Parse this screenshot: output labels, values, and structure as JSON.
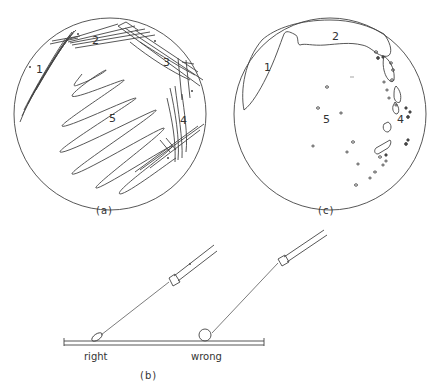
{
  "figure": {
    "panels": [
      {
        "id": "a",
        "caption": "(a)",
        "description": "Streak plate pattern: streak lines",
        "zone_labels": [
          "1",
          "2",
          "3",
          "4",
          "5"
        ]
      },
      {
        "id": "c",
        "caption": "(c)",
        "description": "Resulting growth on plate: confluent growth in zones 1-2, isolated colonies in zones 4-5",
        "zone_labels": [
          "1",
          "2",
          "4",
          "5"
        ]
      },
      {
        "id": "b",
        "caption": "(b)",
        "description": "Inoculating loop angle on agar surface",
        "loop_labels": {
          "right": "right",
          "wrong": "wrong"
        }
      }
    ],
    "colors": {
      "line": "#444444",
      "background": "#ffffff"
    }
  }
}
